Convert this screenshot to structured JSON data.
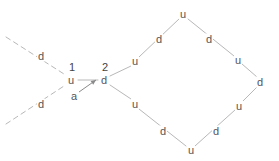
{
  "canvas": {
    "width": 279,
    "height": 161,
    "background": "#ffffff",
    "edge_color": "#b8b8b8",
    "text_color": "#555555",
    "index_color": "#444444",
    "arrow_color": "#8a8a8a"
  },
  "nodes": [
    {
      "id": "n-center-u",
      "label": "u",
      "x": 71,
      "y": 80
    },
    {
      "id": "n-center-d",
      "label": "d",
      "x": 104,
      "y": 80
    },
    {
      "id": "n-upper-left-d",
      "label": "d",
      "x": 41,
      "y": 56
    },
    {
      "id": "n-lower-left-d",
      "label": "d",
      "x": 41,
      "y": 104
    },
    {
      "id": "n-diamond-left-upper-u",
      "label": "u",
      "x": 135,
      "y": 61
    },
    {
      "id": "n-diamond-top-left-d",
      "label": "d",
      "x": 159,
      "y": 39
    },
    {
      "id": "n-diamond-top-u",
      "label": "u",
      "x": 183,
      "y": 14
    },
    {
      "id": "n-diamond-top-right-d",
      "label": "d",
      "x": 209,
      "y": 39
    },
    {
      "id": "n-diamond-right-upper-u",
      "label": "u",
      "x": 238,
      "y": 60
    },
    {
      "id": "n-diamond-right-d",
      "label": "d",
      "x": 260,
      "y": 82
    },
    {
      "id": "n-diamond-right-lower-u",
      "label": "u",
      "x": 239,
      "y": 106
    },
    {
      "id": "n-diamond-bottom-right-d",
      "label": "d",
      "x": 216,
      "y": 131
    },
    {
      "id": "n-diamond-bottom-u",
      "label": "u",
      "x": 191,
      "y": 150
    },
    {
      "id": "n-diamond-bottom-left-d",
      "label": "d",
      "x": 163,
      "y": 131
    },
    {
      "id": "n-diamond-left-lower-u",
      "label": "u",
      "x": 135,
      "y": 104
    }
  ],
  "index_markers": [
    {
      "id": "idx-1",
      "label": "1",
      "x": 72,
      "y": 67
    },
    {
      "id": "idx-2",
      "label": "2",
      "x": 105,
      "y": 67
    }
  ],
  "arrow": {
    "label": "a",
    "label_x": 74,
    "label_y": 96,
    "from_x": 79,
    "from_y": 92,
    "to_x": 96,
    "to_y": 80
  },
  "edges": [
    {
      "id": "e-dashed-upper-left",
      "x1": 6,
      "y1": 37,
      "x2": 64,
      "y2": 74,
      "style": "dashed"
    },
    {
      "id": "e-dashed-lower-left",
      "x1": 6,
      "y1": 124,
      "x2": 64,
      "y2": 86,
      "style": "dashed"
    },
    {
      "id": "e-center-u-to-center-d",
      "x1": 78,
      "y1": 80,
      "x2": 98,
      "y2": 80,
      "style": "solid"
    },
    {
      "id": "e-center-d-to-diamond-left-upper",
      "x1": 110,
      "y1": 76,
      "x2": 131,
      "y2": 66,
      "style": "solid"
    },
    {
      "id": "e-center-d-to-diamond-left-lower",
      "x1": 110,
      "y1": 85,
      "x2": 131,
      "y2": 99,
      "style": "solid"
    },
    {
      "id": "e-dlu-to-dtop",
      "x1": 139,
      "y1": 57,
      "x2": 179,
      "y2": 19,
      "style": "solid"
    },
    {
      "id": "e-dtop-to-dru",
      "x1": 188,
      "y1": 19,
      "x2": 234,
      "y2": 56,
      "style": "solid"
    },
    {
      "id": "e-dru-to-dright",
      "x1": 242,
      "y1": 64,
      "x2": 257,
      "y2": 77,
      "style": "solid"
    },
    {
      "id": "e-dright-to-drl",
      "x1": 257,
      "y1": 87,
      "x2": 243,
      "y2": 101,
      "style": "solid"
    },
    {
      "id": "e-drl-to-dbottom",
      "x1": 235,
      "y1": 110,
      "x2": 195,
      "y2": 146,
      "style": "solid"
    },
    {
      "id": "e-dbottom-to-dll",
      "x1": 186,
      "y1": 146,
      "x2": 139,
      "y2": 109,
      "style": "solid"
    }
  ]
}
